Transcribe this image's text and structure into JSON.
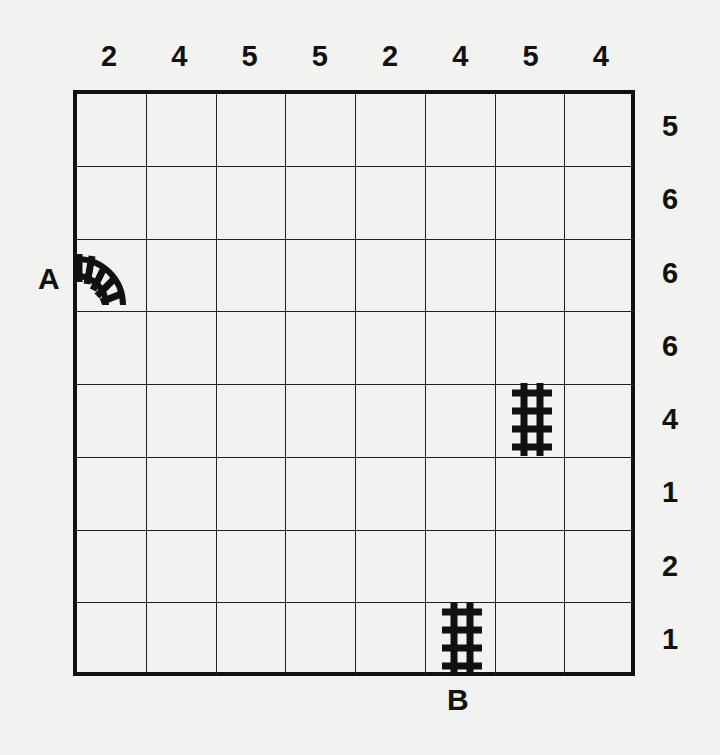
{
  "puzzle": {
    "type": "train-tracks",
    "size": 8,
    "column_clues": [
      "2",
      "4",
      "5",
      "5",
      "2",
      "4",
      "5",
      "4"
    ],
    "row_clues": [
      "5",
      "6",
      "6",
      "6",
      "4",
      "1",
      "2",
      "1"
    ],
    "labels": {
      "start": "A",
      "end": "B"
    },
    "given_pieces": [
      {
        "row": 2,
        "col": 0,
        "type": "curve",
        "connects": [
          "west",
          "south"
        ],
        "label": "A"
      },
      {
        "row": 4,
        "col": 6,
        "type": "straight-vertical"
      },
      {
        "row": 7,
        "col": 5,
        "type": "straight-vertical",
        "label": "B"
      }
    ],
    "colors": {
      "ink": "#111111",
      "paper": "#f2f2f0"
    }
  }
}
